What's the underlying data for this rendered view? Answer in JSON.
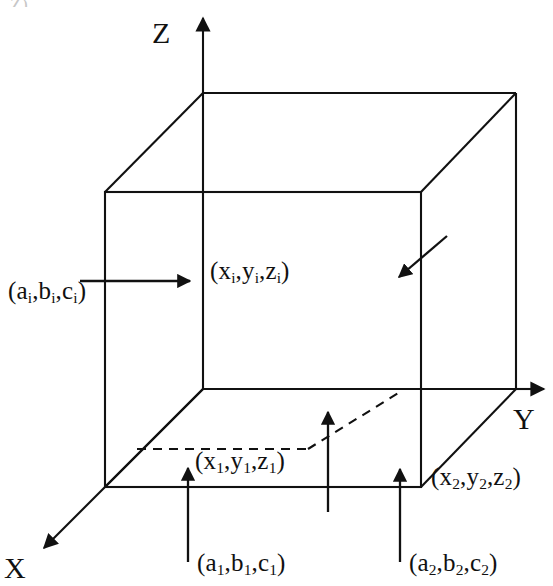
{
  "figure": {
    "type": "diagram",
    "background_color": "#ffffff",
    "stroke_color": "#111111",
    "axes": [
      {
        "name": "z-axis",
        "label": "Z",
        "direction": "up",
        "label_pos": [
          152,
          18
        ]
      },
      {
        "name": "y-axis",
        "label": "Y",
        "direction": "right",
        "label_pos": [
          513,
          400
        ]
      },
      {
        "name": "x-axis",
        "label": "X",
        "direction": "down-left",
        "label_pos": [
          4,
          553
        ]
      }
    ],
    "point_labels": {
      "source_i": "(aᵢ,bᵢ,cᵢ)",
      "target_i": "(xᵢ,yᵢ,zᵢ)",
      "source_1": "(a₁,b₁,c₁)",
      "target_1": "(x₁,y₁,z₁)",
      "source_2": "(a₂,b₂,c₂)",
      "target_2": "(x₂,y₂,z₂)"
    },
    "labels": [
      {
        "id": "source-i",
        "base": "a",
        "text_parts": [
          "(a",
          "i",
          ",b",
          "i",
          ",c",
          "i",
          ")"
        ]
      },
      {
        "id": "target-i",
        "base": "x",
        "text_parts": [
          "(x",
          "i",
          ",y",
          "i",
          ",z",
          "i",
          ")"
        ]
      },
      {
        "id": "target-1",
        "base": "x",
        "text_parts": [
          "(x",
          "1",
          ",y",
          "1",
          ",z",
          "1",
          ")"
        ]
      },
      {
        "id": "target-2",
        "base": "x",
        "text_parts": [
          "(x",
          "2",
          ",y",
          "2",
          ",z",
          "2",
          ")"
        ]
      },
      {
        "id": "source-1",
        "base": "a",
        "text_parts": [
          "(a",
          "1",
          ",b",
          "1",
          ",c",
          "1",
          ")"
        ]
      },
      {
        "id": "source-2",
        "base": "a",
        "text_parts": [
          "(a",
          "2",
          ",b",
          "2",
          ",c",
          "2",
          ")"
        ]
      }
    ],
    "cube": {
      "front_top_left": [
        105,
        192
      ],
      "front_top_right": [
        421,
        192
      ],
      "front_bottom_left": [
        105,
        487
      ],
      "front_bottom_right": [
        421,
        487
      ],
      "back_top_left": [
        203,
        93
      ],
      "back_top_right": [
        516,
        93
      ],
      "back_bottom_right": [
        516,
        389
      ],
      "back_bottom_left_hidden": [
        203,
        389
      ]
    },
    "arrows": {
      "left_horizontal": {
        "from": [
          80,
          281
        ],
        "to": [
          197,
          281
        ]
      },
      "diagonal_into_box": {
        "from": [
          447,
          236
        ],
        "to": [
          393,
          282
        ]
      },
      "bottom_left_up": {
        "from": [
          188,
          560
        ],
        "to": [
          188,
          462
        ]
      },
      "bottom_mid_up": {
        "from": [
          328,
          510
        ],
        "to": [
          328,
          406
        ]
      },
      "bottom_right_up": {
        "from": [
          400,
          560
        ],
        "to": [
          400,
          463
        ]
      }
    },
    "dashed_lines": [
      {
        "from": [
          138,
          449
        ],
        "to": [
          307,
          449
        ]
      },
      {
        "from": [
          307,
          449
        ],
        "to": [
          399,
          393
        ]
      }
    ],
    "clipped_header_fragment": "Z)"
  }
}
